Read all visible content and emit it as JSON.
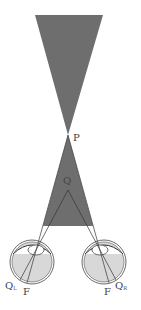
{
  "diagram": {
    "colors": {
      "background": "#ffffff",
      "shaded_region": "#6e6e6e",
      "eye_fill": "#d8d8d8",
      "line": "#333333",
      "label": "#444444"
    },
    "labels": {
      "fixation_point": "P",
      "near_point": "Q",
      "left_retinal_point": "Q",
      "left_retinal_sub": "L",
      "right_retinal_point": "Q",
      "right_retinal_sub": "R",
      "left_fovea": "F",
      "right_fovea": "F"
    },
    "eyes": [
      {
        "name": "left-eye",
        "cx": 32,
        "cy": 262,
        "r": 22
      },
      {
        "name": "right-eye",
        "cx": 104,
        "cy": 262,
        "r": 22
      }
    ]
  }
}
